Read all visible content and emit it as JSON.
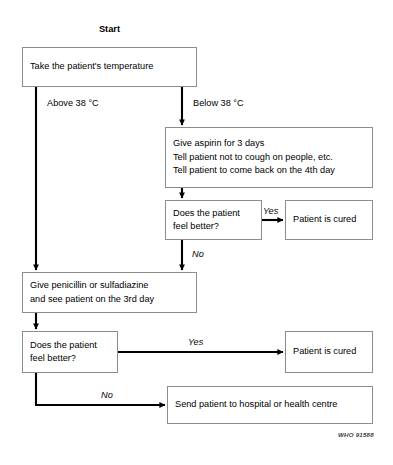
{
  "diagram": {
    "start_label": "Start",
    "credit": "WHO 91588",
    "nodes": [
      {
        "id": "take-temperature",
        "lines": [
          "Take the patient's temperature"
        ]
      },
      {
        "id": "give-aspirin",
        "lines": [
          "Give aspirin for 3 days",
          "Tell patient not to cough on people, etc.",
          "Tell patient to come back on the 4th day"
        ]
      },
      {
        "id": "decision-better-aspirin",
        "lines": [
          "Does the patient",
          "feel better?"
        ]
      },
      {
        "id": "patient-cured-aspirin",
        "lines": [
          "Patient is cured"
        ]
      },
      {
        "id": "give-penicillin",
        "lines": [
          "Give penicillin or sulfadiazine",
          "and see patient on the 3rd day"
        ]
      },
      {
        "id": "decision-better-penicillin",
        "lines": [
          "Does the patient",
          "feel better?"
        ]
      },
      {
        "id": "patient-cured-penicillin",
        "lines": [
          "Patient is cured"
        ]
      },
      {
        "id": "send-to-hospital",
        "lines": [
          "Send patient to hospital or health centre"
        ]
      }
    ],
    "edge_labels": {
      "above_38": "Above 38 °C",
      "below_38": "Below 38 °C",
      "yes_aspirin": "Yes",
      "no_aspirin": "No",
      "yes_penicillin": "Yes",
      "no_penicillin": "No"
    }
  }
}
